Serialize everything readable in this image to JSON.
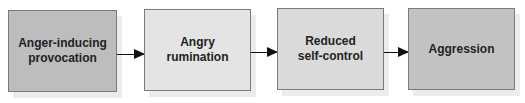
{
  "diagram": {
    "type": "flowchart",
    "direction": "left-to-right",
    "nodes": [
      {
        "id": "n1",
        "lines": [
          "Anger-inducing",
          "provocation"
        ],
        "fill": "#bdbdbd"
      },
      {
        "id": "n2",
        "lines": [
          "Angry",
          "rumination"
        ],
        "fill": "#e4e4e4"
      },
      {
        "id": "n3",
        "lines": [
          "Reduced",
          "self-control"
        ],
        "fill": "#dadada"
      },
      {
        "id": "n4",
        "lines": [
          "Aggression"
        ],
        "fill": "#c2c2c2"
      }
    ],
    "edges": [
      {
        "from": "n1",
        "to": "n2"
      },
      {
        "from": "n2",
        "to": "n3"
      },
      {
        "from": "n3",
        "to": "n4"
      }
    ]
  }
}
